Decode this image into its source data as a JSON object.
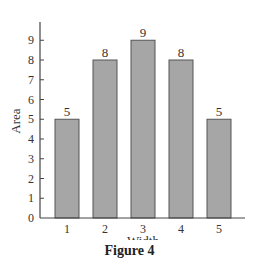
{
  "chart_data": {
    "type": "bar",
    "title": "",
    "categories": [
      "1",
      "2",
      "3",
      "4",
      "5"
    ],
    "values": [
      5,
      8,
      9,
      8,
      5
    ],
    "data_labels": [
      "5",
      "8",
      "9",
      "8",
      "5"
    ],
    "xlabel": "Width",
    "ylabel": "Area",
    "yticks": [
      "0",
      "1",
      "2",
      "3",
      "4",
      "5",
      "6",
      "7",
      "8",
      "9"
    ],
    "ylim": [
      0,
      10
    ],
    "grid": false,
    "legend": null,
    "bar_color": "#a6a6a6",
    "bar_edge_color": "#555555",
    "axis_color": "#444444"
  },
  "caption": "Figure 4"
}
